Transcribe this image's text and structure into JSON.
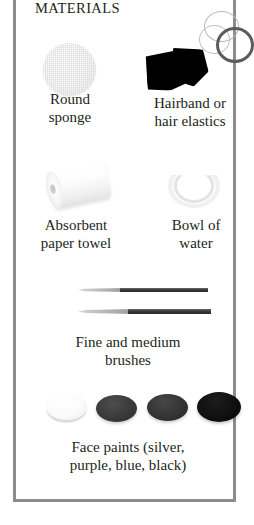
{
  "panel": {
    "title": "MATERIALS",
    "border_color": "#8c8c8c",
    "background_color": "#ffffff",
    "text_color": "#231f20"
  },
  "items": [
    {
      "id": "round-sponge",
      "icon": "round-sponge-icon",
      "caption_line_1": "Round",
      "caption_line_2": "sponge",
      "color": "#f1f1f1"
    },
    {
      "id": "hairband",
      "icon": "hairband-icon",
      "caption_line_1": "Hairband or",
      "caption_line_2": "hair elastics",
      "color": "#000000"
    },
    {
      "id": "paper-towel",
      "icon": "paper-towel-roll-icon",
      "caption_line_1": "Absorbent",
      "caption_line_2": "paper towel",
      "color": "#efefef"
    },
    {
      "id": "bowl-of-water",
      "icon": "bowl-of-water-icon",
      "caption_line_1": "Bowl of",
      "caption_line_2": "water",
      "color": "#f0f0f0"
    },
    {
      "id": "brushes",
      "icon": "paint-brush-icon",
      "caption_line_1": "Fine and medium",
      "caption_line_2": "brushes",
      "color": "#2a2a2a"
    },
    {
      "id": "face-paints",
      "icon": "face-paint-pot-icon",
      "caption_line_1": "Face paints (silver,",
      "caption_line_2": "purple, blue, black)",
      "color": "#101010"
    }
  ],
  "face_paints": [
    {
      "name": "silver",
      "swatch": "#fbfbfb"
    },
    {
      "name": "purple",
      "swatch": "#3a3a3a"
    },
    {
      "name": "blue",
      "swatch": "#343434"
    },
    {
      "name": "black",
      "swatch": "#101010"
    }
  ]
}
